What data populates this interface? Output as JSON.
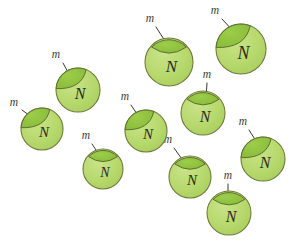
{
  "figure": {
    "title": "",
    "background_color": "#ffffff",
    "width": 290,
    "height": 248,
    "sphere_fill": "#b6d86c",
    "sphere_stroke": "#6f7a3a",
    "cap_fill": "#8dc23f",
    "cap_stroke": "#5e7030",
    "arrow_color": "#3a3a32",
    "label_color": "#2a2a22"
  },
  "legend": {
    "sphere_label": "N",
    "arrow_label": "m"
  },
  "nodes": [
    {
      "id": "sphere-1",
      "label": "N",
      "cx": 78,
      "cy": 90,
      "r": 22,
      "cap": "upper-left",
      "arrow": {
        "label": "m",
        "x1": 63,
        "y1": 63,
        "x2": 69,
        "y2": 74,
        "lx": 56,
        "ly": 55
      }
    },
    {
      "id": "sphere-2",
      "label": "N",
      "cx": 42,
      "cy": 129,
      "r": 21,
      "cap": "upper-left",
      "arrow": {
        "label": "m",
        "x1": 22,
        "y1": 110,
        "x2": 33,
        "y2": 118,
        "lx": 14,
        "ly": 103
      }
    },
    {
      "id": "sphere-3",
      "label": "N",
      "cx": 103,
      "cy": 169,
      "r": 20,
      "cap": "top",
      "arrow": {
        "label": "m",
        "x1": 92,
        "y1": 144,
        "x2": 100,
        "y2": 156,
        "lx": 86,
        "ly": 136
      }
    },
    {
      "id": "sphere-4",
      "label": "N",
      "cx": 146,
      "cy": 131,
      "r": 21,
      "cap": "upper-left",
      "arrow": {
        "label": "m",
        "x1": 131,
        "y1": 105,
        "x2": 139,
        "y2": 117,
        "lx": 125,
        "ly": 97
      }
    },
    {
      "id": "sphere-5",
      "label": "N",
      "cx": 169,
      "cy": 62,
      "r": 24,
      "cap": "top",
      "arrow": {
        "label": "m",
        "x1": 156,
        "y1": 27,
        "x2": 167,
        "y2": 44,
        "lx": 150,
        "ly": 19
      }
    },
    {
      "id": "sphere-6",
      "label": "N",
      "cx": 241,
      "cy": 49,
      "r": 25,
      "cap": "upper-left",
      "arrow": {
        "label": "m",
        "x1": 222,
        "y1": 19,
        "x2": 234,
        "y2": 32,
        "lx": 215,
        "ly": 11
      }
    },
    {
      "id": "sphere-7",
      "label": "N",
      "cx": 203,
      "cy": 113,
      "r": 22,
      "cap": "top",
      "arrow": {
        "label": "m",
        "x1": 207,
        "y1": 83,
        "x2": 206,
        "y2": 98,
        "lx": 207,
        "ly": 75
      }
    },
    {
      "id": "sphere-8",
      "label": "N",
      "cx": 190,
      "cy": 177,
      "r": 21,
      "cap": "top",
      "arrow": {
        "label": "m",
        "x1": 174,
        "y1": 148,
        "x2": 184,
        "y2": 162,
        "lx": 168,
        "ly": 140
      }
    },
    {
      "id": "sphere-9",
      "label": "N",
      "cx": 229,
      "cy": 213,
      "r": 22,
      "cap": "top",
      "arrow": {
        "label": "m",
        "x1": 228,
        "y1": 184,
        "x2": 228,
        "y2": 198,
        "lx": 228,
        "ly": 176
      }
    },
    {
      "id": "sphere-10",
      "label": "N",
      "cx": 263,
      "cy": 159,
      "r": 22,
      "cap": "upper-left",
      "arrow": {
        "label": "m",
        "x1": 249,
        "y1": 130,
        "x2": 258,
        "y2": 144,
        "lx": 243,
        "ly": 122
      }
    }
  ],
  "chart_data": {
    "type": "diagram",
    "title": "",
    "sphere_count": 10,
    "arrow_count": 10,
    "sphere_label": "N",
    "arrow_label": "m",
    "categories": [
      "N",
      "m"
    ],
    "values": [
      10,
      10
    ]
  }
}
